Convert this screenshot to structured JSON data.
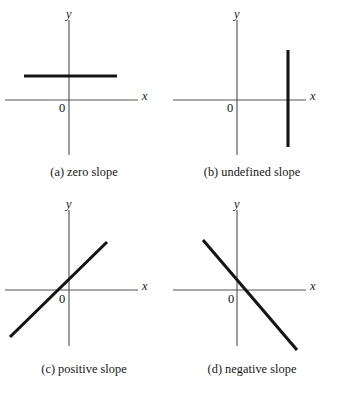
{
  "figure": {
    "type": "diagram",
    "width": 337,
    "height": 393,
    "line_color": "#151515",
    "axis_color": "#555555",
    "background": "#ffffff"
  },
  "panels": [
    {
      "id": "a",
      "tag": "(a)",
      "caption": "zero slope",
      "x_axis_label": "x",
      "y_axis_label": "y",
      "origin_label": "0",
      "line_kind": "horizontal",
      "slope": 0
    },
    {
      "id": "b",
      "tag": "(b)",
      "caption": "undefined slope",
      "x_axis_label": "x",
      "y_axis_label": "y",
      "origin_label": "0",
      "line_kind": "vertical",
      "slope": "undefined"
    },
    {
      "id": "c",
      "tag": "(c)",
      "caption": "positive slope",
      "x_axis_label": "x",
      "y_axis_label": "y",
      "origin_label": "0",
      "line_kind": "rising",
      "slope": "positive"
    },
    {
      "id": "d",
      "tag": "(d)",
      "caption": "negative slope",
      "x_axis_label": "x",
      "y_axis_label": "y",
      "origin_label": "0",
      "line_kind": "falling",
      "slope": "negative"
    }
  ]
}
